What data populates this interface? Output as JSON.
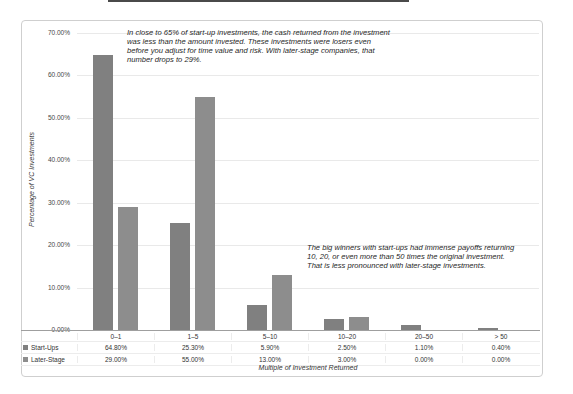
{
  "chart_data": {
    "type": "bar",
    "title": "",
    "categories": [
      "0–1",
      "1–5",
      "5–10",
      "10–20",
      "20–50",
      "> 50"
    ],
    "series": [
      {
        "name": "Start-Ups",
        "color": "#808080",
        "values": [
          64.8,
          25.3,
          5.9,
          2.5,
          1.1,
          0.4
        ],
        "labels": [
          "64.80%",
          "25.30%",
          "5.90%",
          "2.50%",
          "1.10%",
          "0.40%"
        ]
      },
      {
        "name": "Later-Stage",
        "color": "#8d8d8d",
        "values": [
          29.0,
          55.0,
          13.0,
          3.0,
          0.0,
          0.0
        ],
        "labels": [
          "29.00%",
          "55.00%",
          "13.00%",
          "3.00%",
          "0.00%",
          "0.00%"
        ]
      }
    ],
    "xlabel": "Multiple of Investment Returned",
    "ylabel": "Percentage of VC Investments",
    "ylim": [
      0,
      70
    ],
    "ytick_step": 10,
    "ytick_labels": [
      "0.00%",
      "10.00%",
      "20.00%",
      "30.00%",
      "40.00%",
      "50.00%",
      "60.00%",
      "70.00%"
    ],
    "grid": true,
    "legend_position": "data-table-left"
  },
  "annotations": {
    "top_note": "In close to 65% of start-up investments, the cash returned from the investment was less than the amount invested. These investments were losers even before you adjust for time value and risk. With later-stage companies, that number drops to 29%.",
    "bottom_note": "The big winners with start-ups had immense payoffs returning 10, 20, or even more than 50 times the original investment. That is less pronounced with later-stage investments."
  }
}
